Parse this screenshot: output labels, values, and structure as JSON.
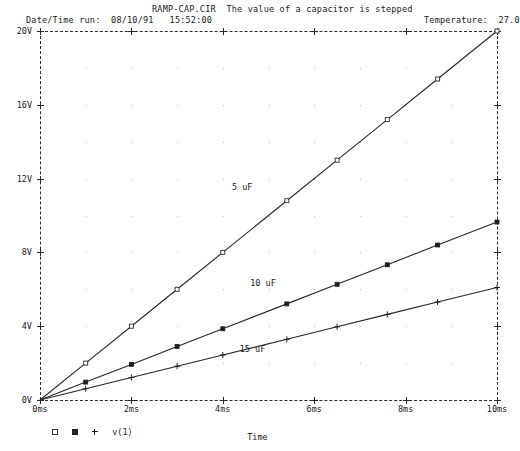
{
  "header": {
    "title": "RAMP-CAP.CIR  The value of a capacitor is stepped",
    "datetime": "Date/Time run:  08/10/91   15:52:00",
    "temperature": "Temperature:  27.0"
  },
  "legend": {
    "marker_open": "open-square-marker",
    "marker_filled": "filled-square-marker",
    "marker_plus": "plus-marker",
    "trace_label": "v(1)"
  },
  "axis_title": "Time",
  "chart_data": {
    "type": "line",
    "title": "RAMP-CAP.CIR  The value of a capacitor is stepped",
    "xlabel": "Time",
    "ylabel": "",
    "xlim": [
      0,
      10
    ],
    "ylim": [
      0,
      20
    ],
    "x_unit": "ms",
    "y_unit": "V",
    "grid": true,
    "legend_position": "below-axis-left",
    "xticklabels": [
      "0ms",
      "2ms",
      "4ms",
      "6ms",
      "8ms",
      "10ms"
    ],
    "xtickvalues": [
      0,
      2,
      4,
      6,
      8,
      10
    ],
    "yticklabels": [
      "0V",
      "4V",
      "8V",
      "12V",
      "16V",
      "20V"
    ],
    "ytickvalues": [
      0,
      4,
      8,
      12,
      16,
      20
    ],
    "annotations": [
      {
        "text": "5 uF",
        "x": 4.55,
        "y": 11.55
      },
      {
        "text": "10 uF",
        "x": 4.95,
        "y": 6.35
      },
      {
        "text": "15 uF",
        "x": 4.72,
        "y": 2.75
      }
    ],
    "series": [
      {
        "name": "5 uF",
        "marker": "open-square",
        "x": [
          0,
          1,
          2,
          3,
          4,
          5.4,
          6.5,
          7.6,
          8.7,
          10
        ],
        "y": [
          0,
          2.0,
          4.0,
          6.0,
          8.0,
          10.8,
          13.0,
          15.2,
          17.4,
          20.0
        ]
      },
      {
        "name": "10 uF",
        "marker": "filled-square",
        "x": [
          0,
          1,
          2,
          3,
          4,
          5.4,
          6.5,
          7.6,
          8.7,
          10
        ],
        "y": [
          0,
          0.97,
          1.93,
          2.9,
          3.86,
          5.21,
          6.27,
          7.33,
          8.4,
          9.65
        ]
      },
      {
        "name": "15 uF",
        "marker": "plus",
        "x": [
          0,
          1,
          2,
          3,
          4,
          5.4,
          6.5,
          7.6,
          8.7,
          10
        ],
        "y": [
          0,
          0.61,
          1.22,
          1.83,
          2.44,
          3.29,
          3.97,
          4.64,
          5.31,
          6.1
        ]
      }
    ]
  }
}
